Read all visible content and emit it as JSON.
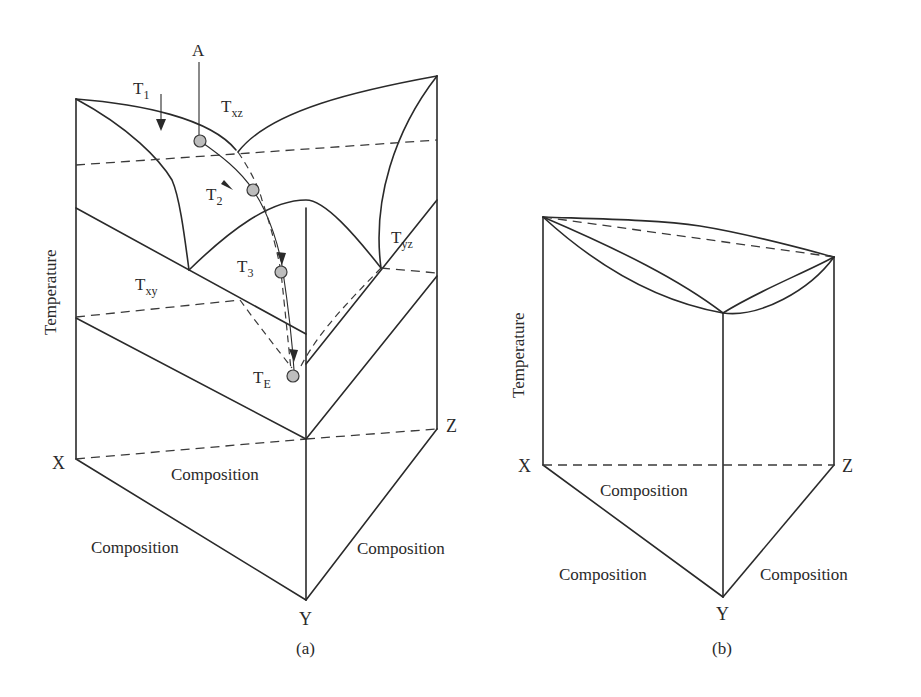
{
  "figure": {
    "panel_a": {
      "caption": "(a)",
      "axis_label": "Temperature",
      "corners": {
        "x": "X",
        "y": "Y",
        "z": "Z"
      },
      "composition_labels": [
        "Composition",
        "Composition",
        "Composition"
      ],
      "start_point": "A",
      "arrow_label": "T",
      "arrow_label_sub": "1",
      "surfaces": [
        {
          "main": "T",
          "sub": "xz"
        },
        {
          "main": "T",
          "sub": "xy"
        },
        {
          "main": "T",
          "sub": "yz"
        }
      ],
      "path_points": [
        {
          "main": "T",
          "sub": "2"
        },
        {
          "main": "T",
          "sub": "3"
        },
        {
          "main": "T",
          "sub": "E"
        }
      ]
    },
    "panel_b": {
      "caption": "(b)",
      "axis_label": "Temperature",
      "corners": {
        "x": "X",
        "y": "Y",
        "z": "Z"
      },
      "composition_labels": [
        "Composition",
        "Composition",
        "Composition"
      ]
    }
  }
}
